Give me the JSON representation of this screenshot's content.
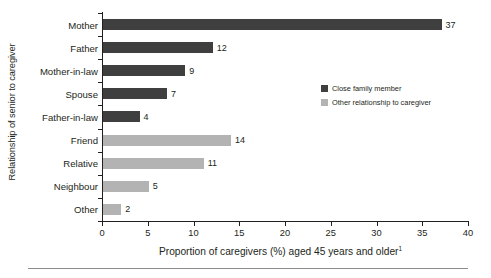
{
  "chart_data": {
    "type": "bar",
    "orientation": "horizontal",
    "title": "",
    "xlabel": "Proportion of caregivers (%) aged 45 years and older",
    "xlabel_footnote": "1",
    "ylabel": "Relationship of senior to caregiver",
    "categories": [
      "Mother",
      "Father",
      "Mother-in-law",
      "Spouse",
      "Father-in-law",
      "Friend",
      "Relative",
      "Neighbour",
      "Other"
    ],
    "values": [
      37,
      12,
      9,
      7,
      4,
      14,
      11,
      5,
      2
    ],
    "value_labels": [
      "37",
      "12",
      "9",
      "7",
      "4",
      "14",
      "11",
      "5",
      "2"
    ],
    "groups": [
      "close",
      "close",
      "close",
      "close",
      "close",
      "other",
      "other",
      "other",
      "other"
    ],
    "xlim": [
      0,
      40
    ],
    "xticks": [
      0,
      5,
      10,
      15,
      20,
      25,
      30,
      35,
      40
    ],
    "xtick_labels": [
      "0",
      "5",
      "10",
      "15",
      "20",
      "25",
      "30",
      "35",
      "40"
    ],
    "grid": false,
    "legend_position": "inside-right",
    "series": [
      {
        "name": "Close family member",
        "key": "close",
        "color": "#3f3f3f"
      },
      {
        "name": "Other relationship to caregiver",
        "key": "other",
        "color": "#b3b3b3"
      }
    ]
  },
  "legend": {
    "items": [
      {
        "label": "Close family member",
        "color": "#3f3f3f"
      },
      {
        "label": "Other relationship to caregiver",
        "color": "#b3b3b3"
      }
    ]
  },
  "colors": {
    "close_family": "#3f3f3f",
    "other_relationship": "#b3b3b3",
    "axis": "#231f20",
    "text": "#231f20",
    "footer_rule": "#8c8c8c",
    "background": "#ffffff"
  }
}
